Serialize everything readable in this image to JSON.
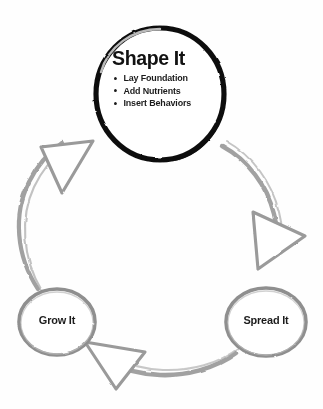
{
  "diagram": {
    "type": "cycle",
    "title": "",
    "direction": "counter-clockwise",
    "background_color": "#ffffff",
    "hub": {
      "id": "shape-it",
      "title": "Shape It",
      "outline_color": "#111111",
      "fill_color": "#ffffff",
      "bullets": [
        "Lay Foundation",
        "Add Nutrients",
        "Insert Behaviors"
      ]
    },
    "nodes": [
      {
        "id": "grow-it",
        "label": "Grow It",
        "outline_color": "#8f8f8f",
        "fill_color": "#ffffff"
      },
      {
        "id": "spread-it",
        "label": "Spread It",
        "outline_color": "#8f8f8f",
        "fill_color": "#ffffff"
      }
    ],
    "arrows": [
      {
        "id": "arrow-to-shape-it",
        "points_to": "Shape It",
        "direction": "up-right",
        "outline_color": "#9a9a9a"
      },
      {
        "id": "arrow-to-spread-it",
        "points_to": "Spread It",
        "direction": "down",
        "outline_color": "#9a9a9a"
      },
      {
        "id": "arrow-to-grow-it",
        "points_to": "Grow It",
        "direction": "left",
        "outline_color": "#9a9a9a"
      }
    ],
    "ring": {
      "stroke_color": "#9c9c9c",
      "style": "brush-stroke-arc"
    }
  }
}
